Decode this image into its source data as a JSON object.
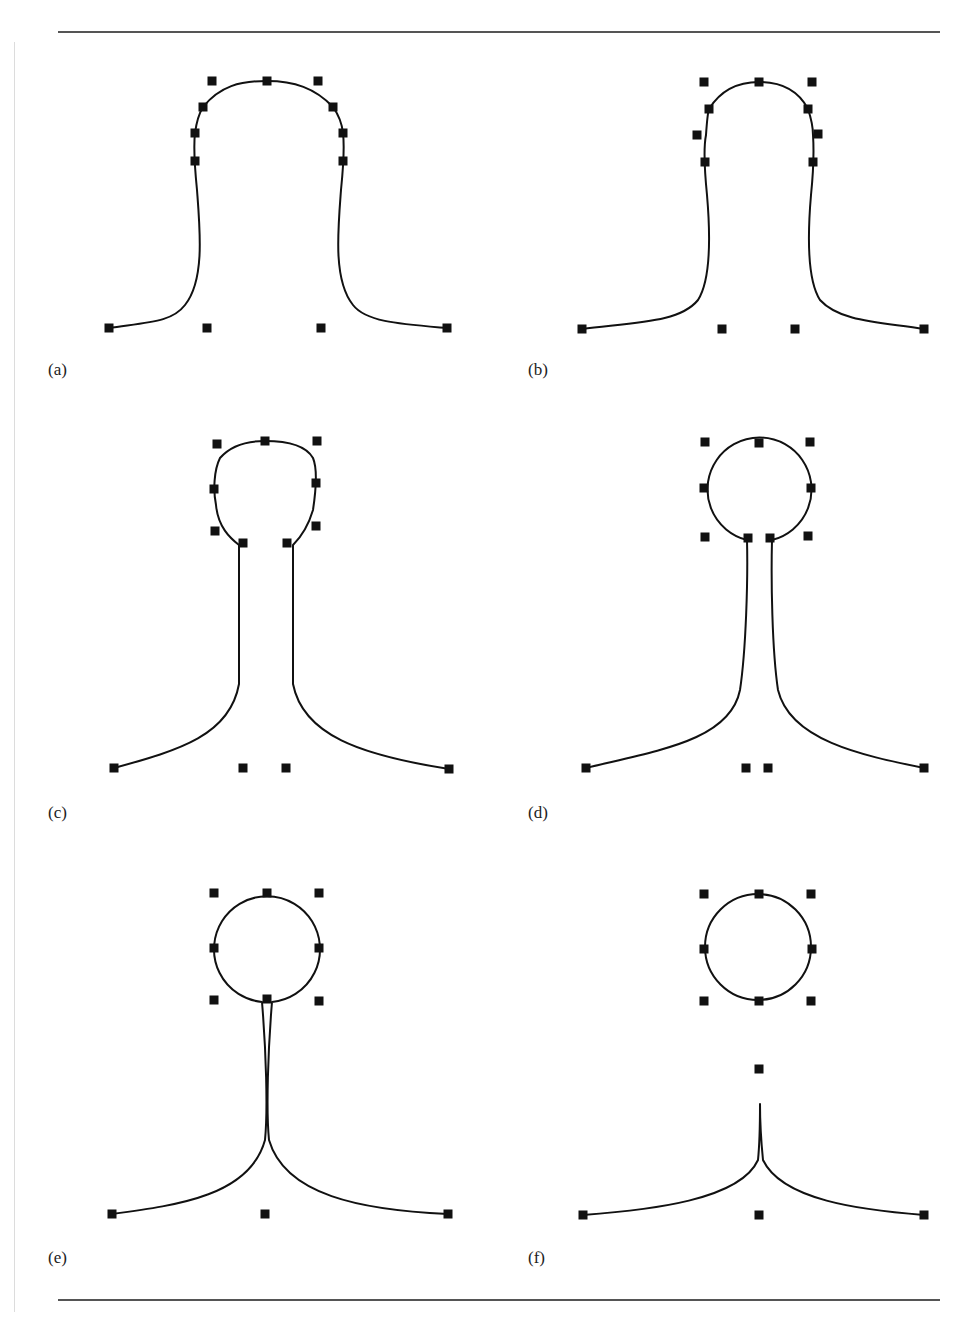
{
  "figure": {
    "panels": [
      {
        "label": "(a)",
        "label_pos": [
          48,
          360
        ],
        "control_points": [
          [
            212,
            81
          ],
          [
            267,
            81
          ],
          [
            318,
            81
          ],
          [
            203,
            107
          ],
          [
            333,
            107
          ],
          [
            195,
            133
          ],
          [
            343,
            133
          ],
          [
            195,
            161
          ],
          [
            343,
            161
          ],
          [
            109,
            328
          ],
          [
            207,
            328
          ],
          [
            321,
            328
          ],
          [
            447,
            328
          ]
        ],
        "curves": [
          "M109,328 C150,322 172,322 185,305 C205,280 200,230 197,190 C195,170 193,150 195,133 C197,118 200,112 203,107 C220,86 240,81 267,81 C294,81 315,88 333,107 C338,114 342,124 343,133 C345,150 343,170 341,190 C338,230 333,280 353,305 C366,322 400,324 447,328"
        ]
      },
      {
        "label": "(b)",
        "label_pos": [
          528,
          360
        ],
        "control_points": [
          [
            704,
            82
          ],
          [
            759,
            82
          ],
          [
            812,
            82
          ],
          [
            709,
            109
          ],
          [
            808,
            109
          ],
          [
            697,
            135
          ],
          [
            818,
            134
          ],
          [
            705,
            162
          ],
          [
            813,
            162
          ],
          [
            582,
            329
          ],
          [
            722,
            329
          ],
          [
            795,
            329
          ],
          [
            924,
            329
          ]
        ],
        "curves": [
          "M582,329 C640,322 680,322 698,300 C712,278 710,230 707,195 C705,175 703,150 706,135 C707,120 708,112 709,109 C722,88 740,82 759,82 C778,82 797,88 808,109 C810,115 813,125 813,135 C814,150 813,175 811,195 C808,230 806,278 820,300 C840,322 880,322 924,329"
        ]
      },
      {
        "label": "(c)",
        "label_pos": [
          48,
          803
        ],
        "control_points": [
          [
            217,
            444
          ],
          [
            265,
            441
          ],
          [
            317,
            441
          ],
          [
            214,
            489
          ],
          [
            316,
            483
          ],
          [
            215,
            531
          ],
          [
            316,
            526
          ],
          [
            243,
            543
          ],
          [
            287,
            543
          ],
          [
            114,
            768
          ],
          [
            243,
            768
          ],
          [
            286,
            768
          ],
          [
            449,
            769
          ]
        ],
        "curves": [
          "M114,768 C180,750 230,735 239,684 L239,545 C230,538 218,527 216,505 C213,490 214,470 220,458 C232,444 250,441 265,441 C285,441 305,444 313,458 C318,470 316,490 313,510 C308,527 300,538 293,545 L293,684 C303,735 360,755 449,769"
        ]
      },
      {
        "label": "(d)",
        "label_pos": [
          528,
          803
        ],
        "control_points": [
          [
            705,
            442
          ],
          [
            759,
            443
          ],
          [
            810,
            442
          ],
          [
            704,
            488
          ],
          [
            811,
            488
          ],
          [
            705,
            537
          ],
          [
            748,
            538
          ],
          [
            770,
            538
          ],
          [
            808,
            536
          ],
          [
            586,
            768
          ],
          [
            746,
            768
          ],
          [
            768,
            768
          ],
          [
            924,
            768
          ]
        ],
        "curves": [
          "M586,768 C660,750 730,740 740,690 C746,650 748,580 747,540 A52,52 0 1,1 772,540 C771,580 772,650 778,690 C790,740 860,755 924,768"
        ]
      },
      {
        "label": "(e)",
        "label_pos": [
          48,
          1248
        ],
        "control_points": [
          [
            214,
            893
          ],
          [
            267,
            893
          ],
          [
            319,
            893
          ],
          [
            214,
            948
          ],
          [
            319,
            948
          ],
          [
            214,
            1000
          ],
          [
            267,
            999
          ],
          [
            319,
            1001
          ],
          [
            112,
            1214
          ],
          [
            265,
            1214
          ],
          [
            448,
            1214
          ]
        ],
        "curves": [
          "M112,1214 C180,1205 250,1195 265,1140 C268,1110 266,1050 262,1002 A53,53 0 1,1 272,1002 C268,1050 266,1110 269,1140 C285,1195 360,1210 448,1214"
        ]
      },
      {
        "label": "(f)",
        "label_pos": [
          528,
          1248
        ],
        "control_points": [
          [
            704,
            894
          ],
          [
            759,
            894
          ],
          [
            811,
            894
          ],
          [
            704,
            949
          ],
          [
            812,
            949
          ],
          [
            704,
            1001
          ],
          [
            759,
            1001
          ],
          [
            811,
            1001
          ],
          [
            759,
            1069
          ],
          [
            583,
            1215
          ],
          [
            759,
            1215
          ],
          [
            924,
            1215
          ]
        ],
        "circle": {
          "cx": 758,
          "cy": 947,
          "r": 53
        },
        "curves": [
          "M583,1215 C650,1210 740,1200 758,1160 C760,1140 760,1120 760,1104 C760,1120 761,1140 763,1160 C782,1200 860,1210 924,1215"
        ]
      }
    ]
  }
}
